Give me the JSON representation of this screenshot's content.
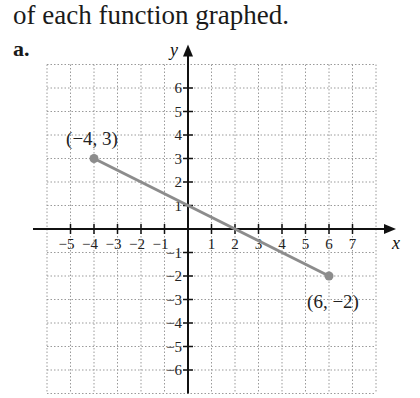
{
  "heading": "of each function graphed.",
  "part_label": "a.",
  "chart_data": {
    "type": "line",
    "title": "",
    "xlabel": "x",
    "ylabel": "y",
    "xlim": [
      -6,
      8
    ],
    "ylim": [
      -7,
      7
    ],
    "grid": true,
    "x_ticks": [
      -5,
      -4,
      -3,
      -2,
      -1,
      1,
      2,
      3,
      4,
      5,
      6,
      7
    ],
    "y_ticks": [
      6,
      5,
      4,
      3,
      2,
      1,
      -1,
      -2,
      -3,
      -4,
      -5,
      -6
    ],
    "series": [
      {
        "name": "segment",
        "x": [
          -4,
          6
        ],
        "y": [
          3,
          -2
        ],
        "color": "#8c8c8c",
        "endpoints": "closed"
      }
    ],
    "annotations": [
      {
        "text": "(−4, 3)",
        "x": -4,
        "y": 3
      },
      {
        "text": "(6, −2)",
        "x": 6,
        "y": -2
      }
    ],
    "intercepts": {
      "x": 2,
      "y": 1
    }
  }
}
